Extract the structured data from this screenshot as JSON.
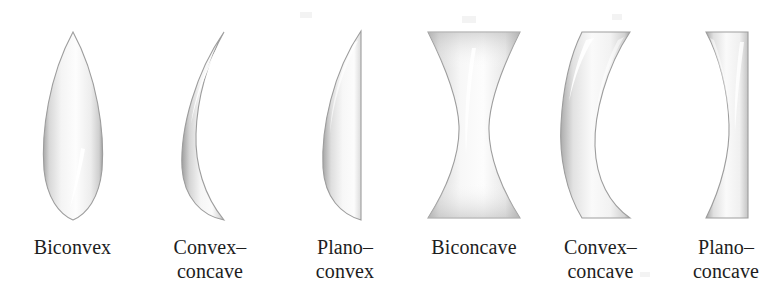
{
  "figure": {
    "background_color": "#ffffff",
    "label_color": "#1d1d1d",
    "lens_edge_color": "#9d9d9d",
    "lens_fill_light": "#fdfdfd",
    "lens_fill_mid": "#e3e3e3",
    "lens_fill_dark": "#b0b0b0",
    "lenses": [
      {
        "id": "biconvex",
        "label": "Biconvex",
        "label_lines": "Biconvex",
        "type": "converging",
        "left_surface": "convex",
        "right_surface": "convex",
        "center_x": 72,
        "width": 56,
        "height": 186
      },
      {
        "id": "convex-concave-converging",
        "label": "Convex–concave",
        "label_lines": "Convex–\nconcave",
        "type": "converging",
        "left_surface": "convex",
        "right_surface": "concave",
        "center_x": 210,
        "width": 50,
        "height": 186
      },
      {
        "id": "plano-convex",
        "label": "Plano–convex",
        "label_lines": "Plano–\nconvex",
        "type": "converging",
        "left_surface": "convex",
        "right_surface": "plano",
        "center_x": 345,
        "width": 42,
        "height": 186
      },
      {
        "id": "biconcave",
        "label": "Biconcave",
        "label_lines": "Biconcave",
        "type": "diverging",
        "left_surface": "concave",
        "right_surface": "concave",
        "center_x": 472,
        "width": 92,
        "height": 182
      },
      {
        "id": "convex-concave-diverging",
        "label": "Convex–concave",
        "label_lines": "Convex–\nconcave",
        "type": "diverging",
        "left_surface": "convex",
        "right_surface": "concave",
        "center_x": 607,
        "width": 78,
        "height": 184
      },
      {
        "id": "plano-concave",
        "label": "Plano–concave",
        "label_lines": "Plano–\nconcave",
        "type": "diverging",
        "left_surface": "concave",
        "right_surface": "plano",
        "center_x": 726,
        "width": 52,
        "height": 184
      }
    ]
  }
}
